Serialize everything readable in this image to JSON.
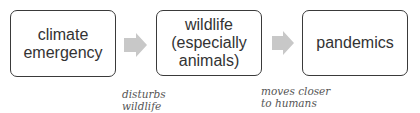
{
  "diagram": {
    "nodes": [
      {
        "id": "climate",
        "label": "climate\nemergency",
        "lines": [
          "climate",
          "emergency"
        ]
      },
      {
        "id": "wildlife",
        "label": "wildlife\n(especially\nanimals)",
        "lines": [
          "wildlife",
          "(especially",
          "animals)"
        ]
      },
      {
        "id": "pandemics",
        "label": "pandemics",
        "lines": [
          "pandemics"
        ]
      }
    ],
    "edges": [
      {
        "from": "climate",
        "to": "wildlife",
        "lines": [
          "disturbs",
          "wildlife"
        ]
      },
      {
        "from": "wildlife",
        "to": "pandemics",
        "lines": [
          "moves closer",
          "to humans"
        ]
      }
    ],
    "colors": {
      "border": "#3a3a3a",
      "arrow": "#c8c8c8",
      "text": "#333333",
      "note": "#555555"
    }
  }
}
